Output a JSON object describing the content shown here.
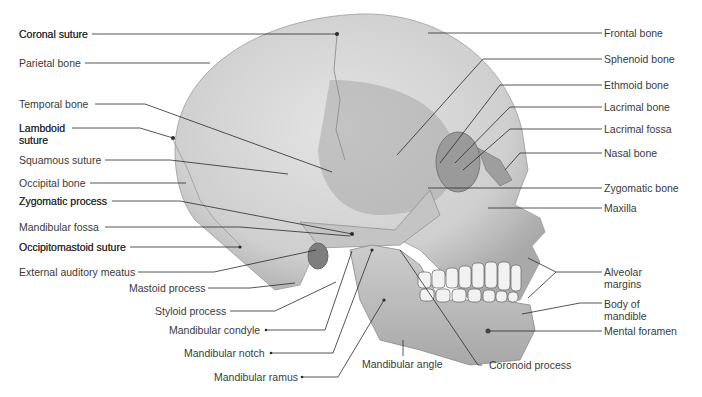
{
  "diagram": {
    "colors": {
      "bone_light": "#d9d9d9",
      "bone_mid": "#bdbdbd",
      "bone_dark": "#8e8e8e",
      "leader_line": "#2b2b2b",
      "label_text": "#3a3a3a"
    },
    "labels_left": [
      {
        "id": "coronal-suture",
        "text": "Coronal suture"
      },
      {
        "id": "parietal-bone",
        "text": "Parietal bone"
      },
      {
        "id": "temporal-bone",
        "text": "Temporal bone"
      },
      {
        "id": "lambdoid-suture",
        "text": "Lambdoid suture"
      },
      {
        "id": "squamous-suture",
        "text": "Squamous suture"
      },
      {
        "id": "occipital-bone",
        "text": "Occipital bone"
      },
      {
        "id": "zygomatic-process",
        "text": "Zygomatic process"
      },
      {
        "id": "mandibular-fossa",
        "text": "Mandibular fossa"
      },
      {
        "id": "occipitomastoid-suture",
        "text": "Occipitomastoid suture"
      },
      {
        "id": "external-auditory-meatus",
        "text": "External auditory meatus"
      },
      {
        "id": "mastoid-process",
        "text": "Mastoid process"
      },
      {
        "id": "styloid-process",
        "text": "Styloid process"
      },
      {
        "id": "mandibular-condyle",
        "text": "Mandibular condyle"
      },
      {
        "id": "mandibular-notch",
        "text": "Mandibular notch"
      },
      {
        "id": "mandibular-ramus",
        "text": "Mandibular ramus"
      }
    ],
    "labels_bottom": [
      {
        "id": "mandibular-angle",
        "text": "Mandibular angle"
      },
      {
        "id": "coronoid-process",
        "text": "Coronoid process"
      }
    ],
    "labels_right": [
      {
        "id": "frontal-bone",
        "text": "Frontal bone"
      },
      {
        "id": "sphenoid-bone",
        "text": "Sphenoid bone"
      },
      {
        "id": "ethmoid-bone",
        "text": "Ethmoid bone"
      },
      {
        "id": "lacrimal-bone",
        "text": "Lacrimal bone"
      },
      {
        "id": "lacrimal-fossa",
        "text": "Lacrimal fossa"
      },
      {
        "id": "nasal-bone",
        "text": "Nasal bone"
      },
      {
        "id": "zygomatic-bone",
        "text": "Zygomatic bone"
      },
      {
        "id": "maxilla",
        "text": "Maxilla"
      },
      {
        "id": "alveolar-margins",
        "text": "Alveolar margins"
      },
      {
        "id": "body-of-mandible",
        "text": "Body of mandible"
      },
      {
        "id": "mental-foramen",
        "text": "Mental foramen"
      }
    ]
  }
}
